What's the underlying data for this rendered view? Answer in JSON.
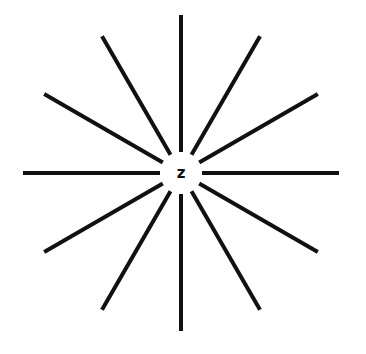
{
  "diagram": {
    "type": "radial-starburst",
    "center_label": "z",
    "center": [
      181,
      173
    ],
    "inner_radius": 21,
    "outer_radius": 158,
    "ray_count": 12,
    "ray_angles_deg": [
      0,
      30,
      60,
      90,
      120,
      150,
      180,
      210,
      240,
      270,
      300,
      330
    ],
    "ray_color": "#111111",
    "background": "#ffffff"
  }
}
